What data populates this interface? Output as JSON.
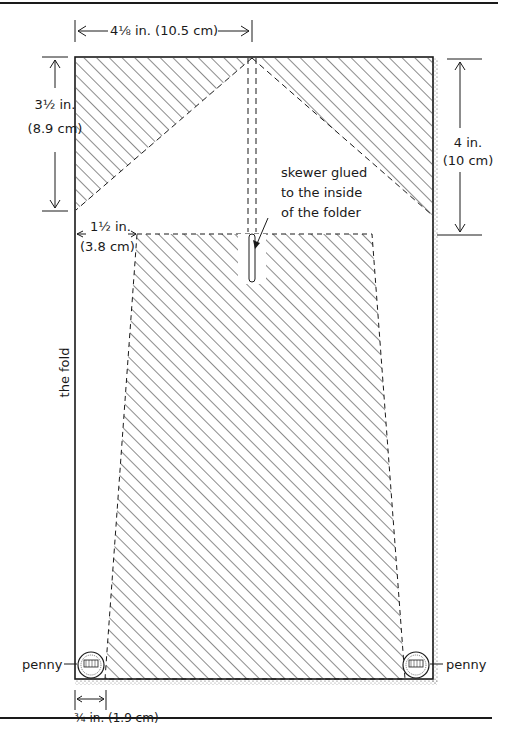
{
  "diagram": {
    "type": "folder pattern / template diagram",
    "dimensions": {
      "top_width": "4⅛ in. (10.5 cm)",
      "left_height_line1": "3½ in.",
      "left_height_line2": "(8.9 cm)",
      "right_height_line1": "4 in.",
      "right_height_line2": "(10 cm)",
      "inset_line1": "1½ in.",
      "inset_line2": "(3.8 cm)",
      "bottom_inset": "¾ in. (1.9 cm)"
    },
    "labels": {
      "skewer_line1": "skewer glued",
      "skewer_line2": "to the inside",
      "skewer_line3": "of the folder",
      "fold": "the fold",
      "penny_left": "penny",
      "penny_right": "penny"
    },
    "colors": {
      "ink": "#1a1a1a",
      "background": "#ffffff",
      "stipple": "#555555"
    }
  }
}
